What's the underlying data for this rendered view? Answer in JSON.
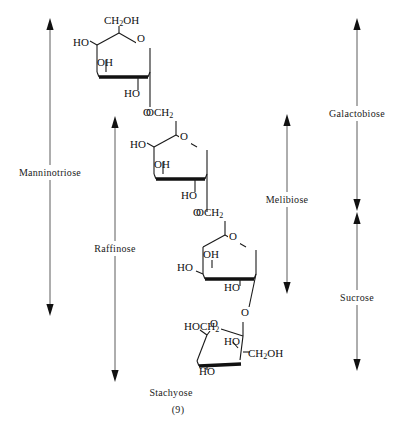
{
  "figure": {
    "caption_name": "Stachyose",
    "caption_number": "(9)",
    "molecule": "stachyose tetrasaccharide Haworth projection"
  },
  "brackets": [
    {
      "name": "manninotriose",
      "label": "Manninotriose",
      "x": 50,
      "y1": 22,
      "y2": 312,
      "label_y": 173,
      "label_anchor": "middle",
      "label_x": 50,
      "orientation": "vertical-double-arrow"
    },
    {
      "name": "raffinose",
      "label": "Raffinose",
      "x": 115,
      "y1": 120,
      "y2": 378,
      "label_y": 249,
      "label_anchor": "middle",
      "label_x": 115,
      "orientation": "vertical-double-arrow"
    },
    {
      "name": "melibiose",
      "label": "Melibiose",
      "x": 287,
      "y1": 118,
      "y2": 290,
      "label_y": 200,
      "label_anchor": "middle",
      "label_x": 287,
      "orientation": "vertical-double-arrow"
    },
    {
      "name": "galactobiose",
      "label": "Galactobiose",
      "x": 357,
      "y1": 22,
      "y2": 207,
      "label_y": 115,
      "label_anchor": "middle",
      "label_x": 357,
      "orientation": "vertical-double-arrow"
    },
    {
      "name": "sucrose",
      "label": "Sucrose",
      "x": 357,
      "y1": 216,
      "y2": 367,
      "label_y": 298,
      "label_anchor": "middle",
      "label_x": 357,
      "orientation": "vertical-double-arrow"
    }
  ],
  "residues": [
    {
      "name": "galactose-terminal",
      "ring_type": "pyranose",
      "labels": [
        {
          "text": "CH",
          "sub": "2",
          "tail": "OH",
          "x": 104,
          "y": 24,
          "anchor": "start"
        },
        {
          "text": "HO",
          "x": 73,
          "y": 46,
          "anchor": "start"
        },
        {
          "text": "OH",
          "x": 97,
          "y": 66,
          "anchor": "start"
        },
        {
          "text": "HO",
          "x": 124,
          "y": 97,
          "anchor": "start"
        }
      ]
    },
    {
      "name": "galactose-internal",
      "ring_type": "pyranose",
      "labels": [
        {
          "text": "OCH",
          "sub": "2",
          "x": 146,
          "y": 116,
          "anchor": "start"
        },
        {
          "text": "HO",
          "x": 130,
          "y": 148,
          "anchor": "start"
        },
        {
          "text": "OH",
          "x": 154,
          "y": 168,
          "anchor": "start"
        },
        {
          "text": "HO",
          "x": 181,
          "y": 199,
          "anchor": "start"
        }
      ]
    },
    {
      "name": "glucose",
      "ring_type": "pyranose",
      "labels": [
        {
          "text": "OCH",
          "sub": "2",
          "x": 196,
          "y": 216,
          "anchor": "start"
        },
        {
          "text": "OH",
          "x": 203,
          "y": 258,
          "anchor": "start"
        },
        {
          "text": "HO",
          "x": 177,
          "y": 271,
          "anchor": "start"
        },
        {
          "text": "HO",
          "x": 224,
          "y": 291,
          "anchor": "start"
        }
      ]
    },
    {
      "name": "fructose",
      "ring_type": "furanose",
      "labels": [
        {
          "text": "HOCH",
          "sub": "2",
          "x": 184,
          "y": 330,
          "anchor": "start"
        },
        {
          "text": "HO",
          "x": 224,
          "y": 345,
          "anchor": "start"
        },
        {
          "text": "CH",
          "sub": "2",
          "tail": "OH",
          "x": 248,
          "y": 357,
          "anchor": "start"
        },
        {
          "text": "HO",
          "x": 199,
          "y": 375,
          "anchor": "start"
        }
      ]
    }
  ],
  "ring_oxygens": [
    {
      "name": "ring-o-galactose-terminal",
      "text": "O",
      "x": 141,
      "y": 42
    },
    {
      "name": "glycosidic-o-1",
      "text": "O",
      "x": 147,
      "y": 116
    },
    {
      "name": "ring-o-galactose-internal",
      "text": "O",
      "x": 184,
      "y": 140
    },
    {
      "name": "glycosidic-o-2",
      "text": "O",
      "x": 197,
      "y": 216
    },
    {
      "name": "ring-o-glucose",
      "text": "O",
      "x": 233,
      "y": 240
    },
    {
      "name": "glycosidic-o-3",
      "text": "O",
      "x": 245,
      "y": 316
    },
    {
      "name": "ring-o-fructose",
      "text": "O",
      "x": 214,
      "y": 327
    }
  ]
}
